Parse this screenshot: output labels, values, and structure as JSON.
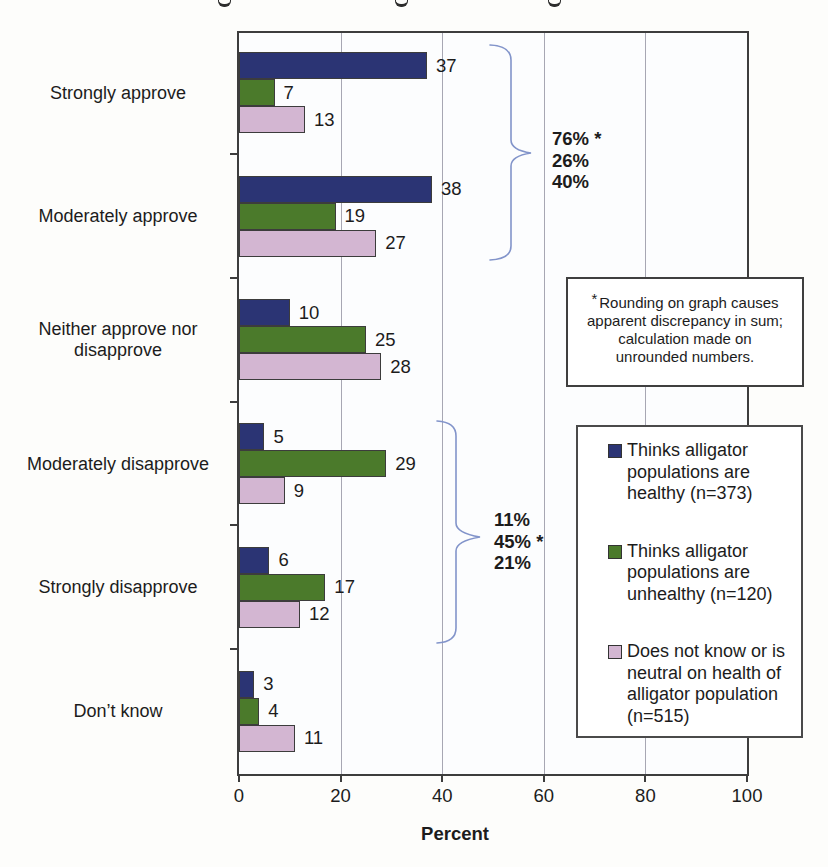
{
  "chart_data": {
    "type": "bar",
    "orientation": "horizontal",
    "xlabel": "Percent",
    "xlim": [
      0,
      100
    ],
    "xticks": [
      0,
      20,
      40,
      60,
      80,
      100
    ],
    "grid": "vertical",
    "value_labels": true,
    "legend_position": "right",
    "bracket_color": "#8294ca",
    "categories": [
      "Strongly approve",
      "Moderately approve",
      "Neither approve nor disapprove",
      "Moderately disapprove",
      "Strongly disapprove",
      "Don’t know"
    ],
    "series": [
      {
        "name": "Thinks alligator populations are healthy (n=373)",
        "color": "#2b3474",
        "values": [
          37,
          38,
          10,
          5,
          6,
          3
        ]
      },
      {
        "name": "Thinks alligator populations are unhealthy (n=120)",
        "color": "#4b7a2b",
        "values": [
          7,
          19,
          25,
          29,
          17,
          4
        ]
      },
      {
        "name": "Does not know or is neutral on health of alligator population (n=515)",
        "color": "#d3b6d2",
        "values": [
          13,
          27,
          28,
          9,
          12,
          11
        ]
      }
    ],
    "annotations": [
      {
        "group": "approve totals",
        "lines": [
          "76% *",
          "26%",
          "40%"
        ]
      },
      {
        "group": "disapprove totals",
        "lines": [
          "11%",
          "45% *",
          "21%"
        ]
      }
    ],
    "footnote_box": {
      "asterisk": "*",
      "lines": [
        "Rounding on graph causes",
        "apparent discrepancy in sum;",
        "calculation made on",
        "unrounded numbers."
      ]
    }
  }
}
